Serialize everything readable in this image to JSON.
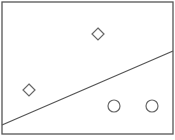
{
  "diagram": {
    "type": "linear-classifier",
    "frame": {
      "x": 2,
      "y": 2,
      "width": 171,
      "height": 132,
      "stroke": "#555555"
    },
    "decision_boundary": {
      "x1": 2,
      "y1": 125,
      "x2": 173,
      "y2": 51,
      "stroke": "#555555"
    },
    "class_a": {
      "shape": "diamond",
      "points": [
        {
          "cx": 98,
          "cy": 34
        },
        {
          "cx": 29,
          "cy": 90
        }
      ]
    },
    "class_b": {
      "shape": "circle",
      "points": [
        {
          "cx": 114,
          "cy": 106
        },
        {
          "cx": 152,
          "cy": 106
        }
      ]
    },
    "marker_size": 6,
    "marker_stroke": "#666666"
  }
}
